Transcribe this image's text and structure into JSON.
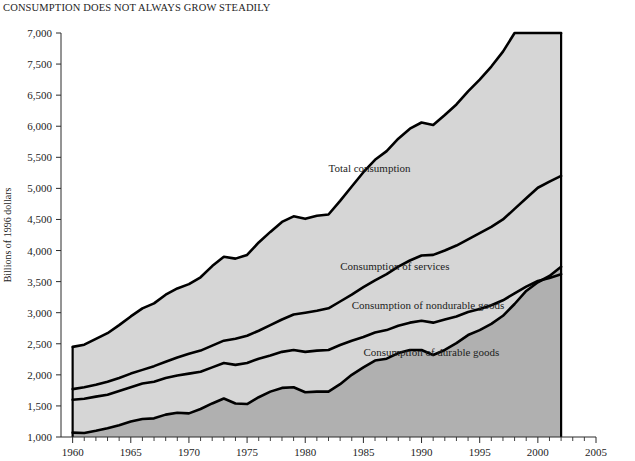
{
  "chart_data": {
    "type": "area",
    "title": "CONSUMPTION DOES NOT ALWAYS GROW STEADILY",
    "xlabel": "",
    "ylabel": "Billions of 1996 dollars",
    "xlim": [
      1959,
      2005
    ],
    "ylim": [
      500,
      7000
    ],
    "grid": false,
    "legend_position": "inline-annotations",
    "ytick_labels": [
      "7,000",
      "7,500",
      "6,500",
      "6,000",
      "5,500",
      "5,000",
      "4,500",
      "4,000",
      "3,500",
      "3,000",
      "2,500",
      "2,000",
      "1,500",
      "1,000",
      "500"
    ],
    "ytick_values": [
      7000,
      6500,
      6000,
      5500,
      5000,
      4500,
      4000,
      3500,
      3000,
      2500,
      2000,
      1500,
      1000,
      500
    ],
    "xtick_labels": [
      "1960",
      "1965",
      "1970",
      "1975",
      "1980",
      "1985",
      "1990",
      "1995",
      "2000",
      "2005"
    ],
    "xtick_values": [
      1960,
      1965,
      1970,
      1975,
      1980,
      1985,
      1990,
      1995,
      2000,
      2005
    ],
    "x": [
      1960,
      1961,
      1962,
      1963,
      1964,
      1965,
      1966,
      1967,
      1968,
      1969,
      1970,
      1971,
      1972,
      1973,
      1974,
      1975,
      1976,
      1977,
      1978,
      1979,
      1980,
      1981,
      1982,
      1983,
      1984,
      1985,
      1986,
      1987,
      1988,
      1989,
      1990,
      1991,
      1992,
      1993,
      1994,
      1995,
      1996,
      1997,
      1998,
      1999,
      2000,
      2001,
      2002
    ],
    "series": [
      {
        "name": "Total consumption",
        "label": "Total consumption",
        "values": [
          1950,
          1985,
          2080,
          2170,
          2300,
          2440,
          2570,
          2650,
          2790,
          2890,
          2960,
          3070,
          3250,
          3400,
          3370,
          3430,
          3630,
          3800,
          3960,
          4050,
          4010,
          4060,
          4080,
          4300,
          4530,
          4760,
          4960,
          5100,
          5300,
          5460,
          5560,
          5520,
          5680,
          5850,
          6060,
          6250,
          6460,
          6700,
          7000,
          7320,
          7590,
          7720,
          7880
        ],
        "display_values": [
          1950,
          1985,
          2080,
          2170,
          2300,
          2440,
          2570,
          2650,
          2790,
          2890,
          2960,
          3070,
          3250,
          3400,
          3370,
          3430,
          3630,
          3800,
          3960,
          4050,
          4010,
          4060,
          4080,
          4300,
          4530,
          4760,
          4960,
          5100,
          5300,
          5460,
          5560,
          5520,
          5680,
          5850,
          6060,
          6250,
          6460,
          6700,
          7000,
          7320,
          7590,
          7720,
          7880
        ],
        "label_x": 1982,
        "label_y": 4760
      },
      {
        "name": "Consumption of services",
        "label": "Consumption of services",
        "values": [
          1270,
          1300,
          1340,
          1390,
          1450,
          1520,
          1580,
          1640,
          1710,
          1780,
          1840,
          1890,
          1970,
          2050,
          2080,
          2130,
          2210,
          2300,
          2390,
          2470,
          2500,
          2530,
          2570,
          2680,
          2790,
          2910,
          3020,
          3120,
          3240,
          3340,
          3420,
          3430,
          3500,
          3580,
          3680,
          3780,
          3880,
          4000,
          4170,
          4340,
          4510,
          4610,
          4700
        ],
        "display_values": [
          1270,
          1300,
          1340,
          1390,
          1450,
          1520,
          1580,
          1640,
          1710,
          1780,
          1840,
          1890,
          1970,
          2050,
          2080,
          2130,
          2210,
          2300,
          2390,
          2470,
          2500,
          2530,
          2570,
          2680,
          2790,
          2910,
          3020,
          3120,
          3240,
          3340,
          3420,
          3430,
          3500,
          3580,
          3680,
          3780,
          3880,
          4000,
          4170,
          4340,
          4510,
          4610,
          4700
        ],
        "label_x": 1983,
        "label_y": 3180
      },
      {
        "name": "Consumption of nondurable goods",
        "label": "Consumption of nondurable goods",
        "values": [
          1100,
          1115,
          1150,
          1180,
          1240,
          1300,
          1360,
          1390,
          1450,
          1490,
          1520,
          1550,
          1620,
          1690,
          1660,
          1690,
          1760,
          1810,
          1870,
          1900,
          1870,
          1890,
          1900,
          1980,
          2050,
          2110,
          2180,
          2220,
          2290,
          2340,
          2370,
          2340,
          2390,
          2440,
          2510,
          2560,
          2620,
          2700,
          2810,
          2920,
          3010,
          3060,
          3120
        ],
        "display_values": [
          1100,
          1115,
          1150,
          1180,
          1240,
          1300,
          1360,
          1390,
          1450,
          1490,
          1520,
          1550,
          1620,
          1690,
          1660,
          1690,
          1760,
          1810,
          1870,
          1900,
          1870,
          1890,
          1900,
          1980,
          2050,
          2110,
          2180,
          2220,
          2290,
          2340,
          2370,
          2340,
          2390,
          2440,
          2510,
          2560,
          2620,
          2700,
          2810,
          2920,
          3010,
          3060,
          3120
        ],
        "label_x": 1984,
        "label_y": 2560
      },
      {
        "name": "Consumption of durable goods",
        "label": "Consumption of durable goods",
        "values": [
          570,
          565,
          600,
          640,
          690,
          750,
          790,
          800,
          860,
          890,
          880,
          950,
          1040,
          1120,
          1040,
          1030,
          1140,
          1230,
          1290,
          1300,
          1220,
          1230,
          1230,
          1350,
          1500,
          1620,
          1730,
          1760,
          1850,
          1900,
          1900,
          1820,
          1900,
          2010,
          2140,
          2220,
          2320,
          2450,
          2640,
          2850,
          2990,
          3090,
          3240
        ],
        "display_values": [
          570,
          565,
          600,
          640,
          690,
          750,
          790,
          800,
          860,
          890,
          880,
          950,
          1040,
          1120,
          1040,
          1030,
          1140,
          1230,
          1290,
          1300,
          1220,
          1230,
          1230,
          1350,
          1500,
          1620,
          1730,
          1760,
          1850,
          1900,
          1900,
          1820,
          1900,
          2010,
          2140,
          2220,
          2320,
          2450,
          2640,
          2850,
          2990,
          3090,
          3240
        ],
        "label_x": 1985,
        "label_y": 1800
      }
    ],
    "colors": {
      "area_light": "#d6d6d6",
      "area_dark": "#b0b0b0",
      "line": "#000000",
      "axis": "#2b2b2b",
      "text": "#1d1d1d",
      "background": "#ffffff"
    }
  }
}
